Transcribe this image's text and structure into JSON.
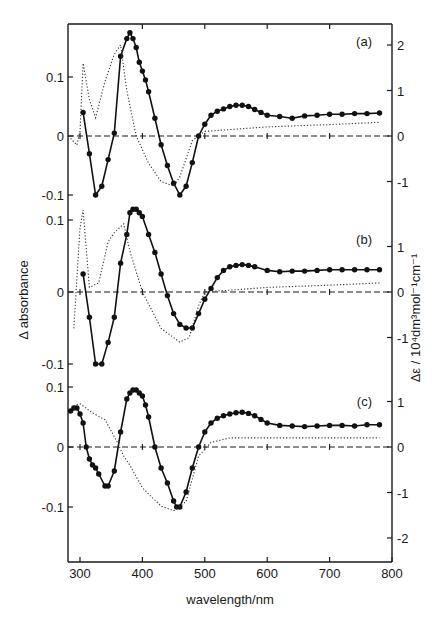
{
  "chart_data": {
    "type": "line",
    "title": "",
    "xlabel": "wavelength/nm",
    "ylabel_left": "Δ absorbance",
    "ylabel_right": "Δε / 10⁴dm³mol⁻¹cm⁻¹",
    "xlim": [
      280,
      800
    ],
    "x_ticks": [
      300,
      400,
      500,
      600,
      700,
      800
    ],
    "grid": false,
    "legend": null,
    "line_styles": {
      "solid_with_dots": "Δ absorbance (measured, left axis)",
      "dotted": "Δε (right axis)",
      "dashed": "zero baseline"
    },
    "panels": [
      {
        "label": "(a)",
        "left_axis": {
          "ticks": [
            0.1,
            0,
            -0.1
          ],
          "tick_labels": [
            "0.1",
            "0",
            "-0.1"
          ]
        },
        "right_axis": {
          "ticks": [
            2,
            1,
            0,
            -1
          ],
          "tick_labels": [
            "2",
            "1",
            "0",
            "-1"
          ]
        },
        "series": [
          {
            "name": "Δ absorbance",
            "style": "solid-dots",
            "x": [
              305,
              315,
              325,
              335,
              345,
              355,
              365,
              375,
              380,
              385,
              390,
              395,
              400,
              405,
              410,
              420,
              430,
              440,
              450,
              460,
              470,
              480,
              490,
              500,
              510,
              520,
              530,
              540,
              550,
              560,
              570,
              580,
              590,
              600,
              620,
              640,
              660,
              680,
              700,
              720,
              740,
              760,
              780
            ],
            "y": [
              0.04,
              -0.03,
              -0.1,
              -0.085,
              -0.04,
              0.005,
              0.135,
              0.165,
              0.175,
              0.165,
              0.15,
              0.125,
              0.11,
              0.095,
              0.075,
              0.03,
              -0.015,
              -0.05,
              -0.08,
              -0.1,
              -0.085,
              -0.045,
              0.0,
              0.02,
              0.035,
              0.042,
              0.046,
              0.05,
              0.052,
              0.052,
              0.05,
              0.045,
              0.04,
              0.035,
              0.033,
              0.03,
              0.034,
              0.035,
              0.037,
              0.037,
              0.038,
              0.038,
              0.039
            ]
          },
          {
            "name": "Δε",
            "style": "dotted",
            "x": [
              285,
              295,
              300,
              305,
              315,
              325,
              340,
              355,
              365,
              375,
              390,
              410,
              430,
              450,
              460,
              470,
              480,
              500,
              600,
              700,
              780
            ],
            "y": [
              -0.05,
              -0.2,
              0.1,
              1.6,
              0.8,
              0.4,
              1.2,
              1.8,
              2.0,
              1.0,
              0.0,
              -0.6,
              -1.0,
              -1.1,
              -0.9,
              -0.5,
              -0.1,
              0.1,
              0.2,
              0.25,
              0.3
            ]
          }
        ]
      },
      {
        "label": "(b)",
        "left_axis": {
          "ticks": [
            0.1,
            0,
            -0.1
          ],
          "tick_labels": [
            "0.1",
            "0",
            "-0.1"
          ]
        },
        "right_axis": {
          "ticks": [
            1,
            0,
            -1
          ],
          "tick_labels": [
            "1",
            "0",
            "-1"
          ]
        },
        "series": [
          {
            "name": "Δ absorbance",
            "style": "solid-dots",
            "x": [
              305,
              315,
              325,
              335,
              345,
              355,
              365,
              375,
              380,
              385,
              390,
              395,
              400,
              410,
              420,
              430,
              440,
              450,
              460,
              470,
              480,
              490,
              500,
              510,
              520,
              530,
              540,
              550,
              560,
              570,
              580,
              600,
              620,
              640,
              660,
              680,
              700,
              720,
              740,
              760,
              780
            ],
            "y": [
              0.025,
              -0.035,
              -0.1,
              -0.1,
              -0.07,
              -0.035,
              0.04,
              0.08,
              0.11,
              0.115,
              0.115,
              0.11,
              0.105,
              0.08,
              0.055,
              0.025,
              -0.005,
              -0.03,
              -0.045,
              -0.05,
              -0.05,
              -0.03,
              -0.01,
              0.005,
              0.02,
              0.03,
              0.035,
              0.037,
              0.038,
              0.037,
              0.035,
              0.03,
              0.028,
              0.029,
              0.029,
              0.03,
              0.031,
              0.031,
              0.031,
              0.031,
              0.031
            ]
          },
          {
            "name": "Δε",
            "style": "dotted",
            "x": [
              290,
              300,
              305,
              315,
              330,
              345,
              355,
              370,
              380,
              400,
              430,
              460,
              475,
              490,
              500,
              600,
              700,
              780
            ],
            "y": [
              -0.8,
              1.4,
              1.8,
              0.1,
              0.2,
              1.1,
              1.3,
              1.5,
              0.9,
              0.0,
              -0.8,
              -1.1,
              -1.0,
              -0.3,
              0.0,
              0.1,
              0.15,
              0.2
            ]
          }
        ]
      },
      {
        "label": "(c)",
        "left_axis": {
          "ticks": [
            0.1,
            0,
            -0.1
          ],
          "tick_labels": [
            "0.1",
            "0",
            "-0.1"
          ]
        },
        "right_axis": {
          "ticks": [
            1,
            0,
            -1,
            -2
          ],
          "tick_labels": [
            "1",
            "0",
            "-1",
            "-2"
          ]
        },
        "series": [
          {
            "name": "Δ absorbance",
            "style": "solid-dots",
            "x": [
              285,
              290,
              295,
              300,
              305,
              310,
              315,
              320,
              325,
              330,
              340,
              345,
              355,
              365,
              375,
              380,
              385,
              390,
              395,
              400,
              405,
              410,
              420,
              430,
              440,
              450,
              455,
              460,
              470,
              480,
              490,
              500,
              510,
              520,
              530,
              540,
              550,
              560,
              570,
              580,
              590,
              600,
              620,
              640,
              660,
              680,
              700,
              720,
              740,
              760,
              780
            ],
            "y": [
              0.06,
              0.065,
              0.065,
              0.055,
              0.04,
              0.0,
              -0.02,
              -0.03,
              -0.035,
              -0.045,
              -0.065,
              -0.065,
              -0.04,
              0.025,
              0.08,
              0.09,
              0.095,
              0.095,
              0.09,
              0.085,
              0.07,
              0.05,
              0.0,
              -0.035,
              -0.06,
              -0.09,
              -0.1,
              -0.1,
              -0.075,
              -0.035,
              0.0,
              0.025,
              0.04,
              0.048,
              0.052,
              0.055,
              0.057,
              0.058,
              0.056,
              0.052,
              0.046,
              0.04,
              0.036,
              0.035,
              0.034,
              0.035,
              0.036,
              0.036,
              0.035,
              0.037,
              0.037
            ]
          },
          {
            "name": "Δε",
            "style": "dotted",
            "x": [
              290,
              300,
              320,
              340,
              360,
              370,
              380,
              400,
              430,
              450,
              470,
              490,
              510,
              540,
              600,
              700,
              780
            ],
            "y": [
              0.9,
              0.95,
              0.75,
              0.6,
              0.1,
              -0.2,
              -0.4,
              -0.9,
              -1.3,
              -1.4,
              -1.2,
              -0.2,
              0.1,
              0.2,
              0.2,
              0.2,
              0.2
            ]
          }
        ]
      }
    ]
  },
  "axes": {
    "x_tick_labels": [
      "300",
      "400",
      "500",
      "600",
      "700",
      "800"
    ],
    "xlabel": "wavelength/nm",
    "ylabel_left": "Δ absorbance",
    "ylabel_right": "Δε / 10⁴dm³mol⁻¹cm⁻¹",
    "panel_labels": [
      "(a)",
      "(b)",
      "(c)"
    ]
  }
}
